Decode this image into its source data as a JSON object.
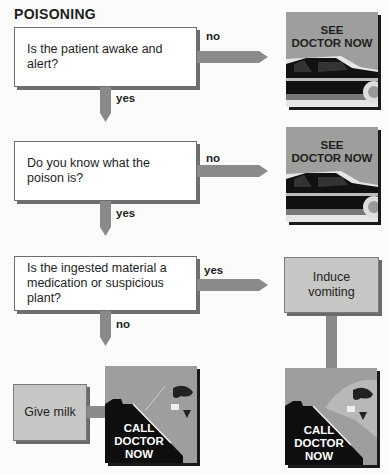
{
  "title": "POISONING",
  "questions": [
    {
      "text": "Is the patient awake and alert?",
      "no_label": "no",
      "yes_label": "yes"
    },
    {
      "text": "Do you know what the poison is?",
      "no_label": "no",
      "yes_label": "yes"
    },
    {
      "text": "Is the ingested material a medication or suspicious plant?",
      "yes_label": "yes",
      "no_label": "no"
    }
  ],
  "actions": {
    "see_doctor": {
      "line1": "SEE",
      "line2": "DOCTOR NOW",
      "icon": "car-icon"
    },
    "induce_vomiting": "Induce vomiting",
    "give_milk": "Give milk",
    "call_doctor": {
      "line1": "CALL",
      "line2": "DOCTOR",
      "line3": "NOW",
      "icon": "phone-hand-icon"
    }
  },
  "colors": {
    "arrow": "#8a8a8a",
    "box_fill": "#c6c6c4",
    "photo_bg": "#9e9e9c"
  }
}
